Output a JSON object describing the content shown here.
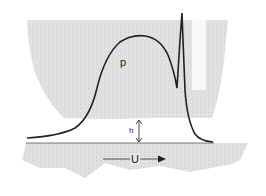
{
  "diagram": {
    "type": "elastohydrodynamic-contact",
    "labels": {
      "pressure": "p",
      "film_thickness": "h",
      "velocity": "U"
    },
    "elements": [
      "upper-body (curved, shaded)",
      "lower-surface (moving, shaded)",
      "pressure-distribution curve with spike",
      "film-thickness double arrow",
      "velocity arrow"
    ],
    "colors": {
      "curve": "#222222",
      "shading": "#d8d8d8",
      "background": "#ffffff"
    }
  }
}
